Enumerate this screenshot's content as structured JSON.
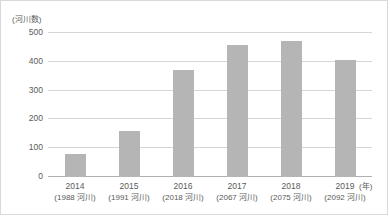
{
  "chart_data": {
    "type": "bar",
    "title": "",
    "subtitle": "",
    "xlabel": "(年)",
    "ylabel": "(河川数)",
    "categories": [
      "2014",
      "2015",
      "2016",
      "2017",
      "2018",
      "2019"
    ],
    "category_sublabels": [
      "(1988 河川)",
      "(1991 河川)",
      "(2018 河川)",
      "(2067 河川)",
      "(2075 河川)",
      "(2092 河川)"
    ],
    "values": [
      80,
      160,
      371,
      457,
      471,
      406
    ],
    "ylim": [
      0,
      500
    ],
    "yticks": [
      0,
      100,
      200,
      300,
      400,
      500
    ],
    "grid": true,
    "legend": "none",
    "bar_color": "#b5b5b5",
    "gridline_color": "#d6d6d6",
    "axis_color": "#b0b0b0",
    "text_color": "#5a5a5a",
    "frame_color": "#d9d9d9"
  }
}
